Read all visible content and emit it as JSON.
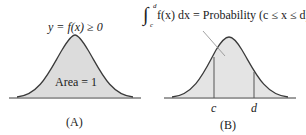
{
  "panel_a": {
    "curve_label": "y = f(x) ≥ 0",
    "area_label": "Area = 1",
    "caption": "(A)"
  },
  "panel_b": {
    "integral_lower": "c",
    "integral_upper": "d",
    "integral_label": "f(x) dx = Probability (c ≤ x ≤ d)",
    "c_label": "c",
    "d_label": "d",
    "caption": "(B)"
  },
  "colors": {
    "fill": "#dcdcdc",
    "stroke": "#3a3a3a",
    "leader": "#8a8a8a"
  }
}
